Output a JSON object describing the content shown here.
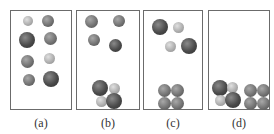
{
  "figure": {
    "panels": [
      {
        "id": "a",
        "label": "(a)",
        "box": {
          "x": 10,
          "y": 10,
          "w": 62,
          "h": 100
        },
        "balls": [
          {
            "x": 28,
            "y": 21,
            "r": 5,
            "tone": "light"
          },
          {
            "x": 48,
            "y": 21,
            "r": 6,
            "tone": "med"
          },
          {
            "x": 27,
            "y": 40,
            "r": 8,
            "tone": "dark"
          },
          {
            "x": 50,
            "y": 38,
            "r": 6.5,
            "tone": "med"
          },
          {
            "x": 27,
            "y": 61,
            "r": 6.5,
            "tone": "med"
          },
          {
            "x": 49,
            "y": 58,
            "r": 5.5,
            "tone": "light"
          },
          {
            "x": 29,
            "y": 80,
            "r": 6,
            "tone": "med"
          },
          {
            "x": 51,
            "y": 79,
            "r": 8,
            "tone": "dark"
          }
        ]
      },
      {
        "id": "b",
        "label": "(b)",
        "box": {
          "x": 76,
          "y": 10,
          "w": 64,
          "h": 100
        },
        "balls": [
          {
            "x": 91,
            "y": 21,
            "r": 6.5,
            "tone": "med"
          },
          {
            "x": 119,
            "y": 21,
            "r": 6,
            "tone": "med"
          },
          {
            "x": 94,
            "y": 40,
            "r": 6,
            "tone": "med"
          },
          {
            "x": 115,
            "y": 45,
            "r": 6.5,
            "tone": "dark"
          },
          {
            "x": 100,
            "y": 88,
            "r": 8,
            "tone": "dark"
          },
          {
            "x": 114,
            "y": 88,
            "r": 5.5,
            "tone": "light"
          },
          {
            "x": 101,
            "y": 101,
            "r": 5.5,
            "tone": "light"
          },
          {
            "x": 114,
            "y": 101,
            "r": 8,
            "tone": "dark"
          }
        ]
      },
      {
        "id": "c",
        "label": "(c)",
        "box": {
          "x": 143,
          "y": 10,
          "w": 60,
          "h": 100
        },
        "balls": [
          {
            "x": 160,
            "y": 27,
            "r": 8,
            "tone": "dark"
          },
          {
            "x": 178,
            "y": 27,
            "r": 5.5,
            "tone": "light"
          },
          {
            "x": 170,
            "y": 46,
            "r": 5.5,
            "tone": "light"
          },
          {
            "x": 189,
            "y": 46,
            "r": 8,
            "tone": "dark"
          },
          {
            "x": 164,
            "y": 90,
            "r": 6.5,
            "tone": "med"
          },
          {
            "x": 177,
            "y": 90,
            "r": 6.5,
            "tone": "med"
          },
          {
            "x": 164,
            "y": 103,
            "r": 6.5,
            "tone": "med"
          },
          {
            "x": 177,
            "y": 103,
            "r": 6.5,
            "tone": "med"
          }
        ]
      },
      {
        "id": "d",
        "label": "(d)",
        "box": {
          "x": 208,
          "y": 10,
          "w": 62,
          "h": 100
        },
        "balls": [
          {
            "x": 220,
            "y": 88,
            "r": 8,
            "tone": "dark"
          },
          {
            "x": 232,
            "y": 87,
            "r": 5.5,
            "tone": "light"
          },
          {
            "x": 220,
            "y": 100,
            "r": 5.5,
            "tone": "light"
          },
          {
            "x": 233,
            "y": 100,
            "r": 8,
            "tone": "dark"
          },
          {
            "x": 250,
            "y": 90,
            "r": 6.5,
            "tone": "med"
          },
          {
            "x": 263,
            "y": 90,
            "r": 6.5,
            "tone": "med"
          },
          {
            "x": 250,
            "y": 103,
            "r": 6.5,
            "tone": "med"
          },
          {
            "x": 263,
            "y": 103,
            "r": 6.5,
            "tone": "med"
          }
        ]
      }
    ]
  }
}
